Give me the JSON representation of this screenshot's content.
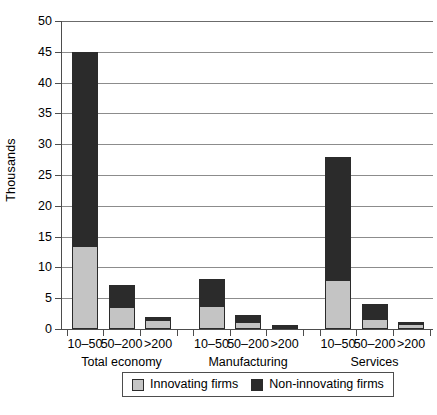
{
  "chart_data": {
    "type": "bar",
    "stacked": true,
    "title": "",
    "subtitle": "",
    "xlabel": "",
    "ylabel": "Thousands",
    "ylim": [
      0,
      50
    ],
    "yticks": [
      0,
      5,
      10,
      15,
      20,
      25,
      30,
      35,
      40,
      45,
      50
    ],
    "ytick_labels": [
      "0",
      "5",
      "10",
      "15",
      "20",
      "25",
      "30",
      "35",
      "40",
      "45",
      "50"
    ],
    "grid": true,
    "grid_axis": "y",
    "legend_position": "bottom",
    "categories": [
      "10–50",
      "50–200",
      ">200",
      "10–50",
      "50–200",
      ">200",
      "10–50",
      "50–200",
      ">200"
    ],
    "groups": [
      {
        "label": "Total economy",
        "categories": [
          "10–50",
          "50–200",
          ">200"
        ]
      },
      {
        "label": "Manufacturing",
        "categories": [
          "10–50",
          "50–200",
          ">200"
        ]
      },
      {
        "label": "Services",
        "categories": [
          "10–50",
          "50–200",
          ">200"
        ]
      }
    ],
    "series": [
      {
        "name": "Innovating firms",
        "color": "#c4c4c4",
        "values": [
          13.5,
          3.5,
          1.4,
          3.8,
          1.2,
          0.4,
          8.0,
          1.6,
          0.8
        ]
      },
      {
        "name": "Non-innovating firms",
        "color": "#2b2b2b",
        "values": [
          31.5,
          3.7,
          0.6,
          4.4,
          1.0,
          0.2,
          20.0,
          2.5,
          0.2
        ]
      }
    ],
    "totals": [
      45.0,
      7.2,
      2.0,
      8.2,
      2.2,
      0.6,
      28.0,
      4.1,
      1.0
    ]
  },
  "legend": {
    "items": [
      {
        "label": "Innovating firms",
        "swatch": "low"
      },
      {
        "label": "Non-innovating firms",
        "swatch": "high"
      }
    ]
  }
}
